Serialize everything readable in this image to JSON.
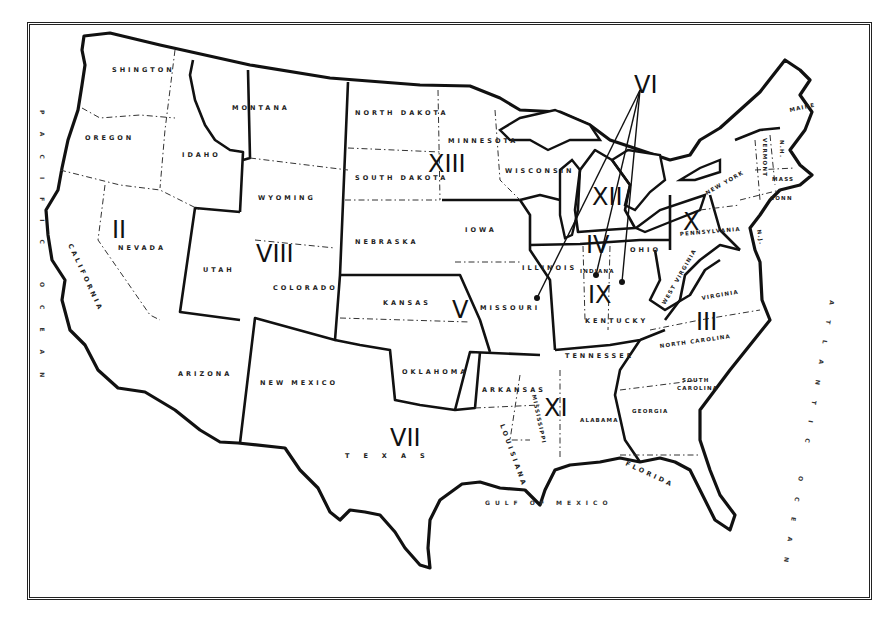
{
  "map": {
    "type": "outline map",
    "subject": "United States regional divisions",
    "colors": {
      "ink": "#111111",
      "paper": "#ffffff"
    }
  },
  "regions": {
    "II": "II",
    "III": "III",
    "IV": "IV",
    "V": "V",
    "VI": "VI",
    "VII": "VII",
    "VIII": "VIII",
    "IX": "IX",
    "X": "X",
    "XI": "XI",
    "XII": "XII",
    "XIII": "XIII"
  },
  "states": {
    "washington": "SHINGTON",
    "oregon": "OREGON",
    "idaho": "IDAHO",
    "montana": "MONTANA",
    "wyoming": "WYOMING",
    "california": "CALIFORNIA",
    "nevada": "NEVADA",
    "utah": "UTAH",
    "colorado": "COLORADO",
    "arizona": "ARIZONA",
    "new_mexico": "NEW MEXICO",
    "north_dakota": "NORTH DAKOTA",
    "south_dakota": "SOUTH DAKOTA",
    "nebraska": "NEBRASKA",
    "kansas": "KANSAS",
    "oklahoma": "OKLAHOMA",
    "texas": "TEXAS",
    "minnesota": "MINNESOTA",
    "iowa": "IOWA",
    "missouri": "MISSOURI",
    "arkansas": "ARKANSAS",
    "louisiana": "LOUISIANA",
    "wisconsin": "WISCONSIN",
    "illinois": "ILLINOIS",
    "indiana": "INDIANA",
    "ohio": "OHIO",
    "kentucky": "KENTUCKY",
    "tennessee": "TENNESSEE",
    "mississippi": "MISSISSIPPI",
    "alabama": "ALABAMA",
    "georgia": "GEORGIA",
    "florida": "FLORIDA",
    "south_carolina_1": "SOUTH",
    "south_carolina_2": "CAROLINA",
    "north_carolina": "NORTH CAROLINA",
    "virginia": "VIRGINIA",
    "west_virginia": "WEST VIRGINIA",
    "pennsylvania": "PENNSYLVANIA",
    "new_york": "NEW YORK",
    "new_jersey": "N.J.",
    "maine": "MAINE",
    "vermont": "VERMONT",
    "new_hampshire": "N.H.",
    "massachusetts": "MASS",
    "connecticut": "CONN"
  },
  "water": {
    "gulf": "GULF OF MEXICO",
    "pacific": "PACIFIC OCEAN",
    "atlantic": "ATLANTIC OCEAN"
  }
}
